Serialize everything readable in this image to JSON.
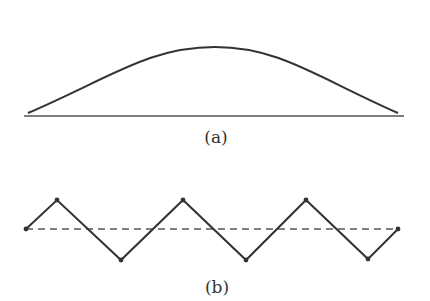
{
  "figure": {
    "panel_a": {
      "label": "(a)",
      "label_pos": {
        "x": 216,
        "y": 129
      },
      "description": "Smooth arch curve resting on a horizontal baseline",
      "baseline": {
        "x1": 24,
        "y1": 116,
        "x2": 404,
        "y2": 116
      },
      "curve": {
        "start": [
          28,
          113
        ],
        "peak": [
          215,
          47
        ],
        "end": [
          398,
          113
        ]
      },
      "stroke_color": "#333333"
    },
    "panel_b": {
      "label": "(b)",
      "label_pos": {
        "x": 217,
        "y": 279
      },
      "description": "Zigzag polyline oscillating about a dashed horizontal reference line",
      "dashed_line": {
        "x1": 26,
        "y1": 229,
        "x2": 398,
        "y2": 229
      },
      "points": [
        [
          26,
          229
        ],
        [
          57,
          200
        ],
        [
          121,
          260
        ],
        [
          183,
          200
        ],
        [
          246,
          260
        ],
        [
          306,
          200
        ],
        [
          368,
          259
        ],
        [
          398,
          229
        ]
      ],
      "stroke_color": "#333333"
    }
  }
}
